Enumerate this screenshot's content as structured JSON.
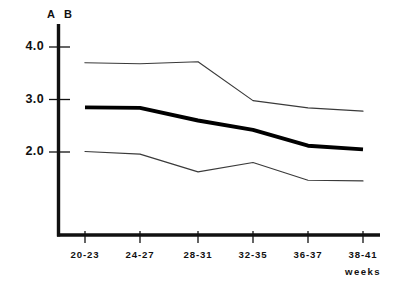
{
  "chart_data": {
    "type": "line",
    "title": "",
    "xlabel": "weeks",
    "ylabel": "",
    "categories": [
      "20-23",
      "24-27",
      "28-31",
      "32-35",
      "36-37",
      "38-41"
    ],
    "ytick_labels": [
      "4.0",
      "3.0",
      "2.0"
    ],
    "ytick_values": [
      4.0,
      3.0,
      2.0
    ],
    "ylim": [
      0.55,
      4.45
    ],
    "xlim": [
      0,
      5
    ],
    "grid": false,
    "legend_position": "top-left-axis",
    "axis_group_labels": [
      "A",
      "B"
    ],
    "series": [
      {
        "name": "upper",
        "style": "thin",
        "values": [
          3.7,
          3.68,
          3.72,
          2.98,
          2.84,
          2.78
        ]
      },
      {
        "name": "median",
        "style": "bold",
        "values": [
          2.85,
          2.84,
          2.6,
          2.42,
          2.12,
          2.05
        ]
      },
      {
        "name": "lower",
        "style": "thin",
        "values": [
          2.01,
          1.96,
          1.62,
          1.8,
          1.46,
          1.45
        ]
      }
    ]
  },
  "labels": {
    "group_a": "A",
    "group_b": "B",
    "ytick_0": "4.0",
    "ytick_1": "3.0",
    "ytick_2": "2.0",
    "xtick_0": "20-23",
    "xtick_1": "24-27",
    "xtick_2": "28-31",
    "xtick_3": "32-35",
    "xtick_4": "36-37",
    "xtick_5": "38-41",
    "x_axis_caption": "weeks"
  },
  "colors": {
    "ink": "#111111",
    "line_thin": "#3a3a3a",
    "line_bold": "#000000",
    "background": "#ffffff"
  }
}
